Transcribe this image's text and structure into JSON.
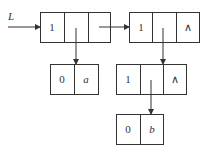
{
  "diagram": {
    "type": "generalized-list-storage",
    "head_pointer": {
      "label": "L"
    },
    "nodes": [
      {
        "id": "n1",
        "cells": [
          "1",
          "",
          ""
        ]
      },
      {
        "id": "n2",
        "cells": [
          "1",
          "",
          "∧"
        ]
      },
      {
        "id": "a",
        "cells": [
          "0",
          "a"
        ]
      },
      {
        "id": "n3",
        "cells": [
          "1",
          "",
          "∧"
        ]
      },
      {
        "id": "b",
        "cells": [
          "0",
          "b"
        ]
      }
    ],
    "edges": [
      {
        "from": "L",
        "to": "n1"
      },
      {
        "from": "n1.hp",
        "to": "a"
      },
      {
        "from": "n1.tp",
        "to": "n2"
      },
      {
        "from": "n2.hp",
        "to": "n3"
      },
      {
        "from": "n3.hp",
        "to": "b"
      }
    ]
  }
}
